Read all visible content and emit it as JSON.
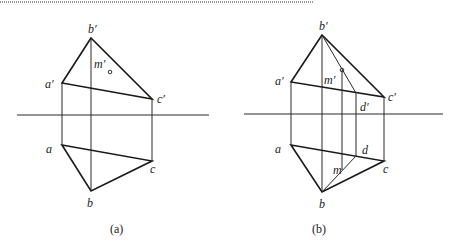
{
  "figure_a": {
    "caption": "(a)",
    "labels": {
      "b_prime": "b′",
      "m_prime": "m′",
      "a_prime": "a′",
      "c_prime": "c′",
      "a": "a",
      "b": "b",
      "c": "c"
    }
  },
  "figure_b": {
    "caption": "(b)",
    "labels": {
      "b_prime": "b′",
      "m_prime": "m′",
      "a_prime": "a′",
      "c_prime": "c′",
      "d_prime": "d′",
      "a": "a",
      "b": "b",
      "c": "c",
      "d": "d",
      "m": "m"
    }
  }
}
